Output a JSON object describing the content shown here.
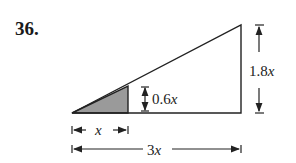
{
  "problem": {
    "number": "36."
  },
  "labels": {
    "small_height": "0.6",
    "large_height": "1.8",
    "small_base": "x",
    "large_base": "3",
    "variable": "x"
  },
  "colors": {
    "stroke": "#222222",
    "shade": "#9a9a9a"
  }
}
